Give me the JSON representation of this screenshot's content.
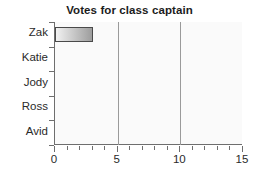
{
  "chart_data": {
    "type": "bar",
    "orientation": "horizontal",
    "title": "Votes for class captain",
    "xlabel": "",
    "ylabel": "",
    "categories": [
      "Avid",
      "Ross",
      "Jody",
      "Katie",
      "Zak"
    ],
    "values": [
      0,
      0,
      0,
      0,
      3
    ],
    "xlim": [
      0,
      15
    ],
    "x_tick_labels": [
      "0",
      "5",
      "10",
      "15"
    ],
    "x_tick_values": [
      0,
      5,
      10,
      15
    ],
    "x_minor_tick_step": 1,
    "gridlines": {
      "x": [
        5,
        10
      ],
      "visible": true
    },
    "legend": {
      "visible": false
    },
    "colors": {
      "bar_gradient_start": "#f2f2f2",
      "bar_gradient_end": "#9d9d9d",
      "bar_border": "#4a4a4a",
      "axis": "#6e6e6e",
      "gridline": "#9a9a9a",
      "plot_background": "#fafafa",
      "text": "#2a2a2a",
      "title_text": "#1c1c1c"
    }
  }
}
